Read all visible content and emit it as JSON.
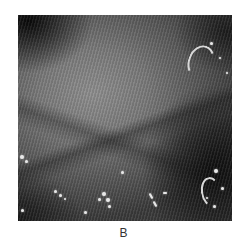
{
  "figure": {
    "panel_label": "B",
    "image_description": "Grayscale endoscopic image of mucosal tissue with diagonal scan-line texture and bright specular highlights",
    "colors": {
      "background": "#ffffff",
      "tissue_light": "#8e8e8e",
      "tissue_dark": "#1a1a1a",
      "highlight": "#e8e8e8"
    }
  }
}
